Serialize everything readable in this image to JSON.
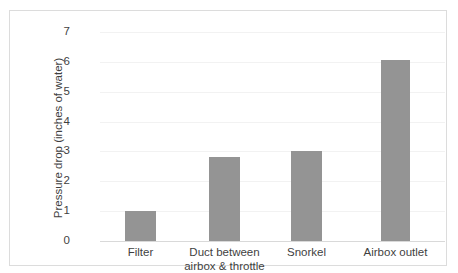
{
  "chart_data": {
    "type": "bar",
    "title": "",
    "xlabel": "",
    "ylabel": "Pressure drop (inches of water)",
    "categories": [
      "Filter",
      "Duct between\nairbox & throttle",
      "Snorkel",
      "Airbox outlet"
    ],
    "values": [
      1.0,
      2.8,
      3.0,
      6.05
    ],
    "ylim": [
      0,
      7
    ],
    "yticks": [
      0,
      1,
      2,
      3,
      4,
      5,
      6,
      7
    ],
    "ytick_labels": [
      "0",
      "1",
      "2",
      "3",
      "4",
      "5",
      "6",
      "7"
    ],
    "grid": true,
    "grid_axis": "y",
    "legend": false,
    "bar_color": "#949494",
    "grid_color": "#f2f2f2",
    "axis_color": "#d9d9d9",
    "text_color": "#3f3f3f",
    "border_color": "#dcdcdc",
    "background": "#ffffff"
  }
}
